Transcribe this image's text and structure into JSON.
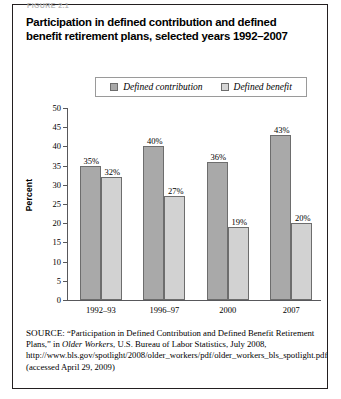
{
  "figure": {
    "label": "FIGURE 2.1",
    "title": "Participation in defined contribution and defined benefit retirement plans, selected years 1992–2007"
  },
  "legend": {
    "items": [
      {
        "label": "Defined contribution",
        "color": "#a9a9a9",
        "key": "defined_contribution"
      },
      {
        "label": "Defined benefit",
        "color": "#d2d2d2",
        "key": "defined_benefit"
      }
    ]
  },
  "axes": {
    "ylabel": "Percent",
    "yticks": [
      "0",
      "5",
      "10",
      "15",
      "20",
      "25",
      "30",
      "35",
      "40",
      "45",
      "50"
    ]
  },
  "source": {
    "prefix": "SOURCE:",
    "text": " “Participation in Defined Contribution and Defined Benefit Retirement Plans,” in ",
    "italic": "Older Workers",
    "text2": ", U.S. Bureau of Labor Statistics, July 2008, http://www.bls.gov/spotlight/2008/older_workers/pdf/older_workers_bls_spotlight.pdf (accessed April 29, 2009)"
  },
  "chart_data": {
    "type": "bar",
    "title": "Participation in defined contribution and defined benefit retirement plans, selected years 1992–2007",
    "xlabel": "",
    "ylabel": "Percent",
    "ylim": [
      0,
      50
    ],
    "ytick_step": 5,
    "grid": false,
    "legend_position": "top-center",
    "categories": [
      "1992–93",
      "1996–97",
      "2000",
      "2007"
    ],
    "series": [
      {
        "name": "Defined contribution",
        "color": "#a9a9a9",
        "values": [
          35,
          40,
          36,
          43
        ],
        "labels": [
          "35%",
          "40%",
          "36%",
          "43%"
        ]
      },
      {
        "name": "Defined benefit",
        "color": "#d2d2d2",
        "values": [
          32,
          27,
          19,
          20
        ],
        "labels": [
          "32%",
          "27%",
          "19%",
          "20%"
        ]
      }
    ]
  }
}
